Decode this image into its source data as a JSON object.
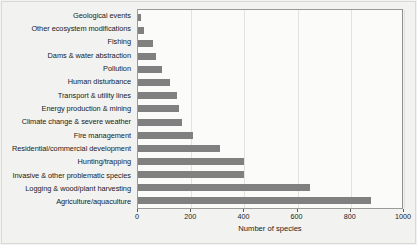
{
  "chart_data": {
    "type": "bar",
    "orientation": "horizontal",
    "title": "",
    "xlabel": "Number of species",
    "ylabel": "",
    "xlim": [
      0,
      1000
    ],
    "xticks": [
      0,
      200,
      400,
      600,
      800,
      1000
    ],
    "xtick_labels": [
      "0",
      "200",
      "400",
      "600",
      "800",
      "1000"
    ],
    "grid": true,
    "grid_axis": "x",
    "legend": false,
    "bar_color": "#808080",
    "plot_background": "#fbfbfa",
    "figure_background": "#f2f2f0",
    "categories": [
      "Geological events",
      "Other ecosystem modifications",
      "Fishing",
      "Dams & water abstraction",
      "Pollution",
      "Human disturbance",
      "Transport & utility lines",
      "Energy production & mining",
      "Climate change & severe weather",
      "Fire management",
      "Residential/commercial development",
      "Hunting/trapping",
      "Invasive & other problematic species",
      "Logging & wood/plant harvesting",
      "Agriculture/aquaculture"
    ],
    "values": [
      12,
      22,
      55,
      66,
      91,
      120,
      145,
      155,
      167,
      205,
      310,
      400,
      400,
      645,
      875
    ]
  }
}
